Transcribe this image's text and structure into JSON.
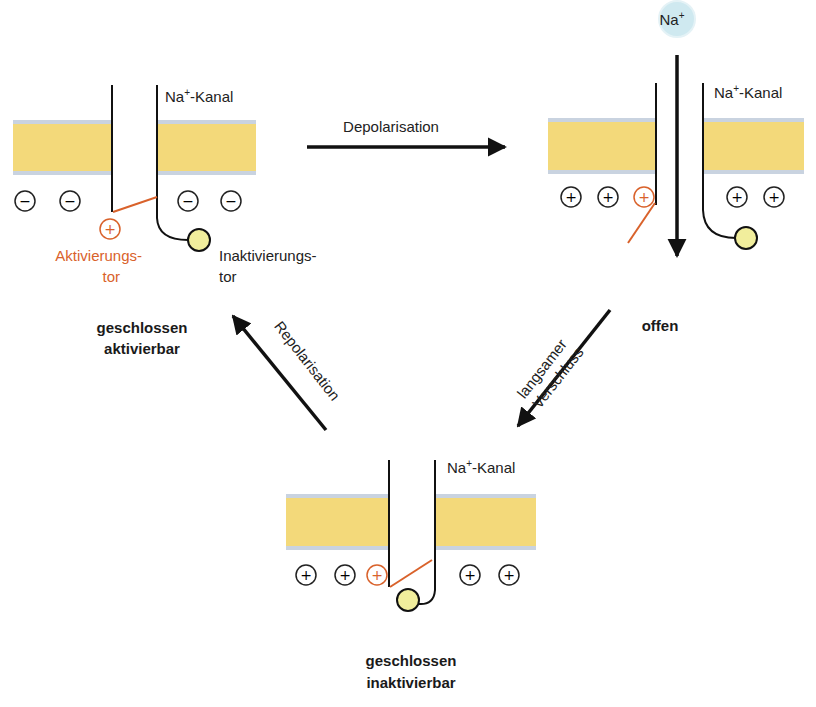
{
  "diagram": {
    "colors": {
      "membrane_fill": "#f3d97a",
      "membrane_edge": "#c9d3e0",
      "activation_gate": "#d9622b",
      "inactivation_ball": "#f1ee9c",
      "ion_fill": "#cfe9f0",
      "line": "#111111"
    },
    "ion": {
      "label": "Na",
      "charge": "+"
    },
    "states": [
      {
        "id": "closed-activatable",
        "channel_label": "Na",
        "channel_label_sup": "+",
        "channel_label_suffix": "-Kanal",
        "state_line1": "geschlossen",
        "state_line2": "aktivierbar",
        "charges": [
          "−",
          "−",
          "−",
          "−"
        ],
        "gate_charge": "+",
        "activation_gate_label_line1": "Aktivierungs-",
        "activation_gate_label_line2": "tor",
        "inactivation_gate_label_line1": "Inaktivierungs-",
        "inactivation_gate_label_line2": "tor"
      },
      {
        "id": "open",
        "channel_label": "Na",
        "channel_label_sup": "+",
        "channel_label_suffix": "-Kanal",
        "state_line1": "offen",
        "charges": [
          "+",
          "+",
          "+",
          "+"
        ],
        "gate_charge": "+"
      },
      {
        "id": "closed-inactivatable",
        "channel_label": "Na",
        "channel_label_sup": "+",
        "channel_label_suffix": "-Kanal",
        "state_line1": "geschlossen",
        "state_line2": "inaktivierbar",
        "charges": [
          "+",
          "+",
          "+",
          "+"
        ],
        "gate_charge": "+"
      }
    ],
    "transitions": [
      {
        "from": "closed-activatable",
        "to": "open",
        "label": "Depolarisation"
      },
      {
        "from": "open",
        "to": "closed-inactivatable",
        "label_line1": "langsamer",
        "label_line2": "Verschluss"
      },
      {
        "from": "closed-inactivatable",
        "to": "closed-activatable",
        "label": "Repolarisation"
      }
    ]
  }
}
